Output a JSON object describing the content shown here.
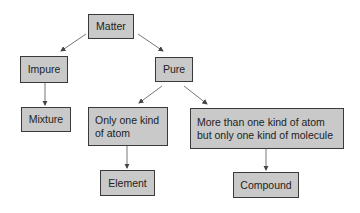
{
  "diagram": {
    "type": "classification-tree",
    "nodes": {
      "matter": {
        "label": "Matter"
      },
      "impure": {
        "label": "Impure"
      },
      "pure": {
        "label": "Pure"
      },
      "mixture": {
        "label": "Mixture"
      },
      "one_atom": {
        "label": "Only one kind of atom"
      },
      "multi_atom": {
        "label": "More than one kind of atom but only one kind of molecule"
      },
      "element": {
        "label": "Element"
      },
      "compound": {
        "label": "Compound"
      }
    },
    "edges": [
      {
        "from": "Matter",
        "to": "Impure"
      },
      {
        "from": "Matter",
        "to": "Pure"
      },
      {
        "from": "Impure",
        "to": "Mixture"
      },
      {
        "from": "Pure",
        "to": "Only one kind of atom"
      },
      {
        "from": "Pure",
        "to": "More than one kind of atom but only one kind of molecule"
      },
      {
        "from": "Only one kind of atom",
        "to": "Element"
      },
      {
        "from": "More than one kind of atom but only one kind of molecule",
        "to": "Compound"
      }
    ],
    "colors": {
      "box_fill": "#c9c9c9",
      "box_border": "#3a3a3a",
      "arrow": "#555555"
    }
  }
}
